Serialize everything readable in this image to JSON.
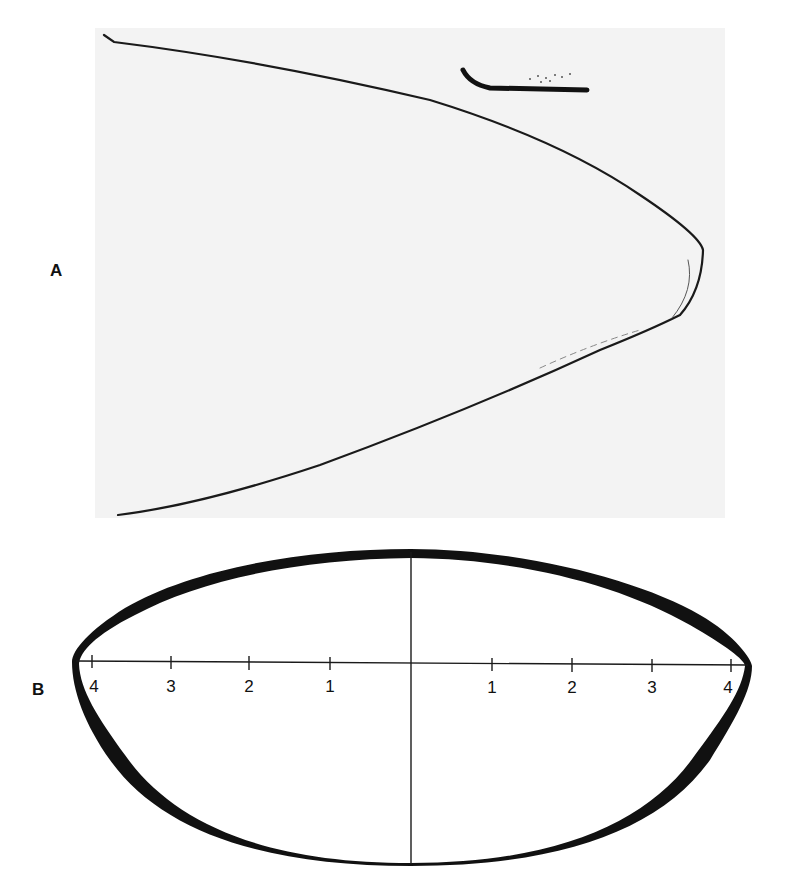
{
  "figure": {
    "panels": [
      {
        "id": "A",
        "label": "A",
        "kind": "photograph",
        "description": "Photograph of a curved parabolic outline (profile) with a small dark curved mark near the top"
      },
      {
        "id": "B",
        "label": "B",
        "kind": "line-drawing",
        "description": "Cross-section outline with variable wall thickness on horizontal and vertical axes",
        "axis": {
          "left_ticks": [
            "4",
            "3",
            "2",
            "1"
          ],
          "right_ticks": [
            "1",
            "2",
            "3",
            "4"
          ]
        }
      }
    ]
  }
}
